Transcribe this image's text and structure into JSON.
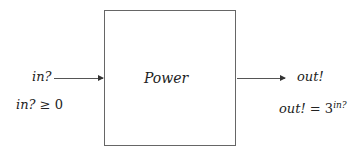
{
  "process": {
    "name": "Power"
  },
  "input": {
    "label": "in?",
    "precondition_var": "in?",
    "precondition_op": "≥",
    "precondition_val": "0"
  },
  "output": {
    "label": "out!",
    "postcondition_var": "out!",
    "postcondition_op": "=",
    "postcondition_base": "3",
    "postcondition_exp": "in?"
  }
}
